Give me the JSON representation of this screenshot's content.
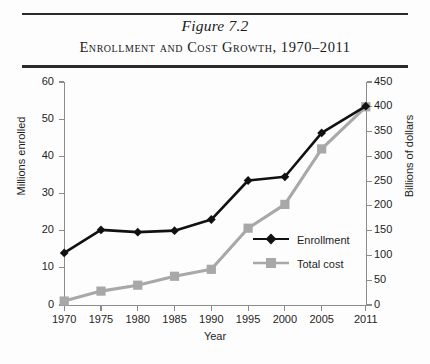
{
  "figure": {
    "number": "Figure 7.2",
    "title": "Enrollment and Cost Growth, 1970–2011"
  },
  "chart_data": {
    "type": "line",
    "title": "Enrollment and Cost Growth, 1970–2011",
    "xlabel": "Year",
    "ylabel": "Millions enrolled",
    "y2label": "Billions of dollars",
    "grid": false,
    "legend_position": "inside-center-right",
    "categories": [
      "1970",
      "1975",
      "1980",
      "1985",
      "1990",
      "1995",
      "2000",
      "2005",
      "2011"
    ],
    "x": [
      1970,
      1975,
      1980,
      1985,
      1990,
      1995,
      2000,
      2005,
      2011
    ],
    "ylim": [
      0,
      60
    ],
    "yticks": [
      0,
      10,
      20,
      30,
      40,
      50,
      60
    ],
    "y2lim": [
      0,
      450
    ],
    "y2ticks": [
      0,
      50,
      100,
      150,
      200,
      250,
      300,
      350,
      400,
      450
    ],
    "series": [
      {
        "name": "Enrollment",
        "axis": "left",
        "unit": "millions",
        "color": "#111111",
        "marker": "diamond",
        "values": [
          14.0,
          20.2,
          19.6,
          20.0,
          23.0,
          33.5,
          34.5,
          46.3,
          53.5
        ]
      },
      {
        "name": "Total cost",
        "axis": "right",
        "unit": "billions of dollars",
        "color": "#a8a8a8",
        "marker": "square",
        "values": [
          8,
          28,
          40,
          58,
          72,
          155,
          203,
          315,
          400
        ]
      }
    ]
  },
  "legend": {
    "items": [
      {
        "label": "Enrollment",
        "marker": "diamond-marker",
        "color": "#111111"
      },
      {
        "label": "Total cost",
        "marker": "square-marker",
        "color": "#a8a8a8"
      }
    ]
  }
}
